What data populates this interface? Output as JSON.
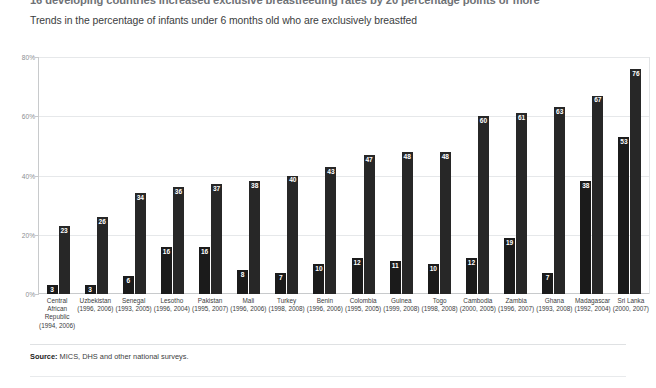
{
  "header": {
    "title": "16 developing countries increased exclusive breastfeeding rates by 20 percentage points or more",
    "subtitle": "Trends in the percentage of infants under 6 months old who are exclusively breastfed"
  },
  "footer": {
    "source_label": "Source:",
    "source_text": " MICS, DHS and other national surveys."
  },
  "chart_data": {
    "type": "bar",
    "title": "16 developing countries increased exclusive breastfeeding rates by 20 percentage points or more",
    "subtitle": "Trends in the percentage of infants under 6 months old who are exclusively breastfed",
    "xlabel": "",
    "ylabel": "",
    "ylim": [
      0,
      80
    ],
    "yticks": [
      "0%",
      "20%",
      "40%",
      "60%",
      "80%"
    ],
    "ytick_values": [
      0,
      20,
      40,
      60,
      80
    ],
    "grid": true,
    "legend": "none",
    "bar_color": "#1b1b1b",
    "categories": [
      "Central African Republic",
      "Uzbekistan",
      "Senegal",
      "Lesotho",
      "Pakistan",
      "Mali",
      "Turkey",
      "Benin",
      "Colombia",
      "Guinea",
      "Togo",
      "Cambodia",
      "Zambia",
      "Ghana",
      "Madagascar",
      "Sri Lanka"
    ],
    "category_years": [
      "(1994, 2006)",
      "(1996, 2006)",
      "(1993, 2005)",
      "(1996, 2004)",
      "(1995, 2007)",
      "(1996, 2006)",
      "(1998, 2008)",
      "(1996, 2006)",
      "(1995, 2005)",
      "(1999, 2008)",
      "(1998, 2008)",
      "(2000, 2005)",
      "(1996, 2007)",
      "(1993, 2008)",
      "(1992, 2004)",
      "(2000, 2007)"
    ],
    "series": [
      {
        "name": "Earlier survey",
        "values": [
          3,
          3,
          6,
          16,
          16,
          8,
          7,
          10,
          12,
          11,
          10,
          12,
          19,
          7,
          38,
          53
        ]
      },
      {
        "name": "Later survey",
        "values": [
          23,
          26,
          34,
          36,
          37,
          38,
          40,
          43,
          47,
          48,
          48,
          60,
          61,
          63,
          67,
          76
        ]
      }
    ]
  }
}
